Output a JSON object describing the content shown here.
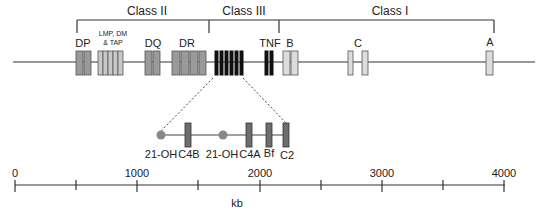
{
  "classes": [
    {
      "label": "Class II",
      "x1": 77,
      "x2": 209
    },
    {
      "label": "Class III",
      "x1": 209,
      "x2": 279
    },
    {
      "label": "Class I",
      "x1": 279,
      "x2": 494
    }
  ],
  "gene_labels": {
    "dp": "DP",
    "lmp_line1": "LMP, DM",
    "lmp_line2": "& TAP",
    "dq": "DQ",
    "dr": "DR",
    "tnf": "TNF",
    "b": "B",
    "c": "C",
    "a": "A"
  },
  "class3_detail": {
    "labels": [
      "21-OH",
      "C4B",
      "21-OH",
      "C4A",
      "Bf",
      "C2"
    ]
  },
  "scale": {
    "ticks": [
      "0",
      "1000",
      "2000",
      "3000",
      "4000"
    ],
    "unit": "kb"
  },
  "colors": {
    "class2_gene": "#9a9a9a",
    "class1_gene": "#dcdcdc",
    "class3_gene": "#111111",
    "detail_gene": "#6e6e6e",
    "line": "#333333"
  }
}
